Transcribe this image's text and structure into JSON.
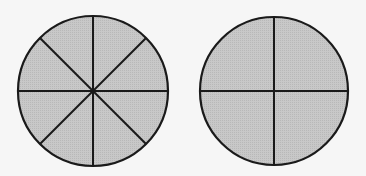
{
  "diagram": {
    "background": "#f6f6f6",
    "fill_color": "#c4c4c4",
    "stroke_color": "#1a1a1a",
    "circles": [
      {
        "name": "circle-eighths",
        "cx": 93,
        "cy": 91,
        "r": 75,
        "divisions": 8
      },
      {
        "name": "circle-quarters",
        "cx": 274,
        "cy": 91,
        "r": 74,
        "divisions": 4
      }
    ]
  }
}
